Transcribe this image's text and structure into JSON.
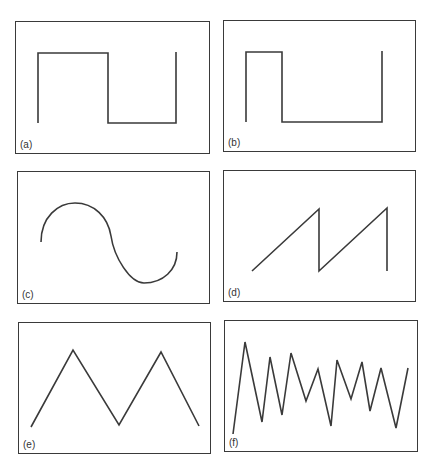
{
  "figure": {
    "stroke_color": "#3a3a3a",
    "panels": [
      {
        "id": "a",
        "label": "(a)",
        "waveform": "square",
        "x": 15,
        "y": 21,
        "w": 195,
        "h": 133,
        "points": "22,31 92,31 92,101 160,101 160,30",
        "start": "22,101"
      },
      {
        "id": "b",
        "label": "(b)",
        "waveform": "rectangular-pulse",
        "x": 223,
        "y": 20,
        "w": 193,
        "h": 132,
        "points": "22,31 58,31 58,101 158,101 158,30",
        "start": "22,101"
      },
      {
        "id": "c",
        "label": "(c)",
        "waveform": "sine",
        "x": 17,
        "y": 171,
        "w": 193,
        "h": 133
      },
      {
        "id": "d",
        "label": "(d)",
        "waveform": "sawtooth",
        "x": 223,
        "y": 170,
        "w": 193,
        "h": 132
      },
      {
        "id": "e",
        "label": "(e)",
        "waveform": "triangle",
        "x": 18,
        "y": 322,
        "w": 193,
        "h": 132
      },
      {
        "id": "f",
        "label": "(f)",
        "waveform": "irregular",
        "x": 224,
        "y": 320,
        "w": 194,
        "h": 132
      }
    ]
  }
}
